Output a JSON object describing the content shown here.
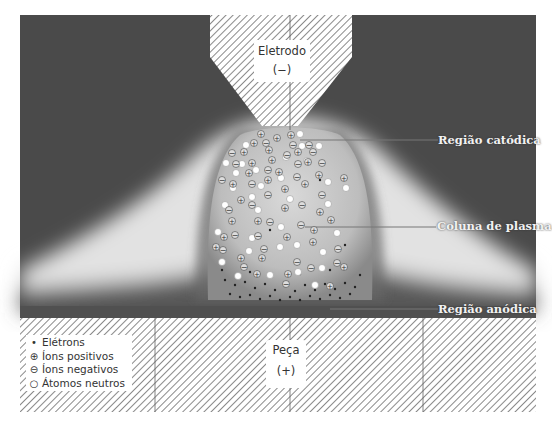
{
  "diagram": {
    "colors": {
      "background_dark": "#4a4a4a",
      "glow": "#e6e6e6",
      "hatch": "#8a8a8a",
      "label_text": "#f2f2f2"
    },
    "electrode": {
      "name": "Eletrodo",
      "polarity": "(−)"
    },
    "workpiece": {
      "name": "Peça",
      "polarity": "(+)"
    },
    "regions": [
      {
        "id": "cathode",
        "label": "Região catódica"
      },
      {
        "id": "plasma",
        "label": "Coluna de plasma"
      },
      {
        "id": "anode",
        "label": "Região anódica"
      }
    ],
    "legend": [
      {
        "symbol": "•",
        "label": "Elétrons"
      },
      {
        "symbol": "⊕",
        "label": "Íons positivos"
      },
      {
        "symbol": "⊖",
        "label": "Íons negativos"
      },
      {
        "symbol": "○",
        "label": "Átomos neutros"
      }
    ]
  }
}
